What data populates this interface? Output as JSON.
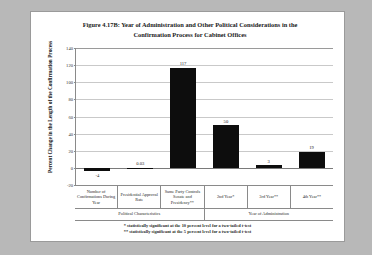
{
  "figure": {
    "title_line1": "Figure 4.17B: Year of Administration and Other Political Considerations in the",
    "title_line2": "Confirmation Process for Cabinet Offices",
    "footnote_1": "* statistically significant at the 10 percent level for a two-tailed t-test",
    "footnote_2": "** statistically significant at the 5 percent level for a two-tailed t-test"
  },
  "chart_data": {
    "type": "bar",
    "title": "Figure 4.17B: Year of Administration and Other Political Considerations in the Confirmation Process for Cabinet Offices",
    "xlabel": "",
    "ylabel": "Percent Change in the Length of the Confirmation Process",
    "ylim": [
      -20,
      140
    ],
    "yticks": [
      -20,
      0,
      20,
      40,
      60,
      80,
      100,
      120,
      140
    ],
    "ytick_labels": [
      "-20",
      "0",
      "20",
      "40",
      "60",
      "80",
      "100",
      "120",
      "140"
    ],
    "grid": true,
    "legend": "none",
    "bar_color": "#0d0d0d",
    "categories": [
      "Number of Confirmations During Year",
      "Presidential Approval Rate",
      "Same Party Controls Senate and Presidency**",
      "2nd Year*",
      "3rd Year**",
      "4th Year**"
    ],
    "values": [
      -4,
      0.03,
      117,
      50,
      3,
      19
    ],
    "value_labels": [
      "-4",
      "0.03",
      "117",
      "50",
      "3",
      "19"
    ],
    "groups": [
      {
        "label": "Political Characteristics",
        "span": 3
      },
      {
        "label": "Year of Administration",
        "span": 3
      }
    ]
  }
}
